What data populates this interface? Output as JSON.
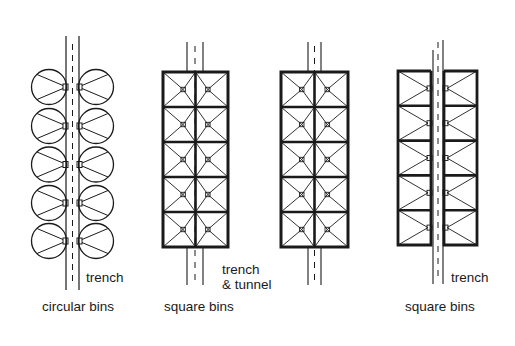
{
  "diagram": {
    "type": "plan-view schematic",
    "colors": {
      "ink": "#1a1a1a",
      "background": "#ffffff"
    },
    "panels": [
      {
        "id": "circular",
        "caption": "circular bins",
        "corridor_label": "trench",
        "bin_shape": "circle",
        "rows": 5,
        "columns": 2,
        "corridor": "trench"
      },
      {
        "id": "square-trench-tunnel",
        "caption": "square bins",
        "corridor_label_line1": "trench",
        "corridor_label_line2": "& tunnel",
        "bin_shape": "square",
        "rows": 5,
        "columns": 2,
        "corridor": "trench & tunnel"
      },
      {
        "id": "square-tunnel-variant",
        "caption": "",
        "bin_shape": "square",
        "rows": 5,
        "columns": 2,
        "corridor": "trench & tunnel"
      },
      {
        "id": "square-trench",
        "caption": "square bins",
        "corridor_label": "trench",
        "bin_shape": "square",
        "rows": 5,
        "columns": 2,
        "corridor": "trench"
      }
    ]
  }
}
